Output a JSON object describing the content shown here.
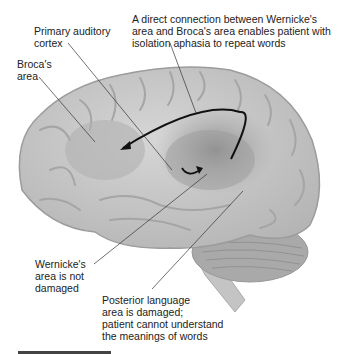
{
  "figure": {
    "labels": {
      "primary_auditory_cortex": "Primary auditory\ncortex",
      "brocas_area": "Broca's\narea",
      "direct_connection": "A direct connection between Wernicke's\narea and Broca's area enables patient with\nisolation aphasia to repeat words",
      "wernickes_area": "Wernicke's\narea is not\ndamaged",
      "posterior_language_area": "Posterior language\narea is damaged;\npatient cannot understand\nthe meanings of words"
    },
    "colors": {
      "brain_base": "#c8c8c8",
      "brain_highlight": "#e2e2e2",
      "shaded_region": "#9a9a9a",
      "arrow": "#111111",
      "leader_line": "#333333"
    }
  }
}
